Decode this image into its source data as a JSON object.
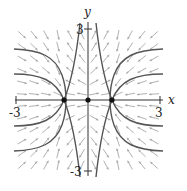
{
  "diagram": {
    "type": "phase-portrait",
    "axes": {
      "x_label": "x",
      "y_label": "y",
      "x_range": [
        -3,
        3
      ],
      "y_range": [
        -3,
        3
      ],
      "x_tick_labels": [
        "-3",
        "3"
      ],
      "y_tick_labels": [
        "3",
        "-3"
      ]
    },
    "equilibria": [
      {
        "x": -1,
        "y": 0
      },
      {
        "x": 0,
        "y": 0
      },
      {
        "x": 1,
        "y": 0
      }
    ],
    "colors": {
      "axis": "#333333",
      "curve": "#555555",
      "arrow": "#a8a8a8",
      "point": "#111111"
    }
  }
}
